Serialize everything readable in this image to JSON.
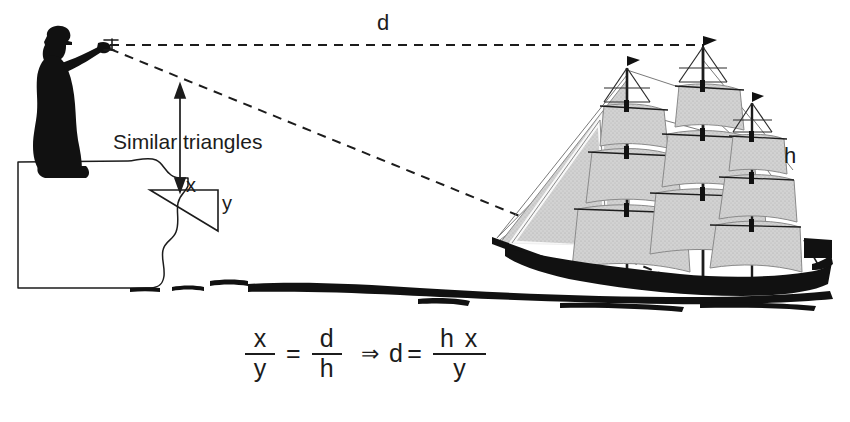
{
  "diagram": {
    "labels": {
      "distance": "d",
      "ship_height": "h",
      "triangle_x": "x",
      "triangle_y": "y",
      "similar_triangles": "Similar triangles"
    },
    "formula": {
      "left_fraction": {
        "numerator": "x",
        "denominator": "y"
      },
      "equals": "=",
      "right_fraction": {
        "numerator": "d",
        "denominator": "h"
      },
      "implies": "⇒",
      "result_variable": "d",
      "result_equals": "=",
      "result_fraction": {
        "numerator": "h x",
        "denominator": "y"
      }
    },
    "scene": {
      "observer": "silhouetted figure with sextant standing on cliff",
      "cliff": "cliff outline at left",
      "ship": "three-masted sailing ship with gray sails",
      "water": "waterline"
    },
    "colors": {
      "ink": "#1c1c1c",
      "sail_fill": "#cfcfcf",
      "rigging": "#6a6a6a",
      "hull": "#111111",
      "background": "#ffffff"
    }
  }
}
